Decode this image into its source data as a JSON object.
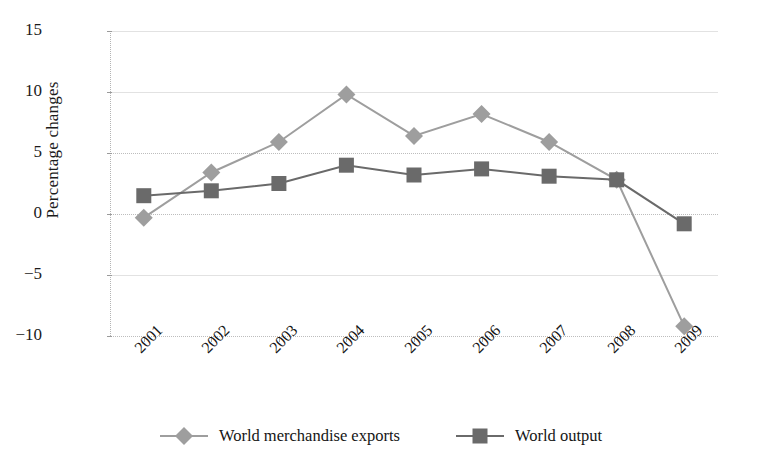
{
  "chart_data": {
    "type": "line",
    "title": "",
    "xlabel": "",
    "ylabel": "Percentage changes",
    "categories": [
      "2001",
      "2002",
      "2003",
      "2004",
      "2005",
      "2006",
      "2007",
      "2008",
      "2009"
    ],
    "ylim": [
      -10,
      15
    ],
    "yticks": [
      15,
      10,
      5,
      0,
      -5,
      -10
    ],
    "ytick_labels": [
      "15",
      "10",
      "5",
      "0",
      "−5",
      "−10"
    ],
    "grid": true,
    "legend_position": "bottom",
    "series": [
      {
        "name": "World merchandise exports",
        "marker": "diamond",
        "color": "#9e9e9e",
        "values": [
          -0.3,
          3.4,
          5.9,
          9.8,
          6.4,
          8.2,
          5.9,
          2.8,
          -9.2
        ]
      },
      {
        "name": "World output",
        "marker": "square",
        "color": "#6a6a6a",
        "values": [
          1.5,
          1.9,
          2.5,
          4.0,
          3.2,
          3.7,
          3.1,
          2.8,
          -0.8
        ]
      }
    ]
  },
  "legend": {
    "items": [
      {
        "label": "World merchandise exports",
        "marker": "diamond-marker-icon"
      },
      {
        "label": "World output",
        "marker": "square-marker-icon"
      }
    ]
  },
  "colors": {
    "exports_series": "#9e9e9e",
    "output_series": "#6a6a6a",
    "gridline": "#e2e2e2",
    "axis": "#b4b4b4",
    "text": "#1b1b1b",
    "background": "#ffffff"
  }
}
